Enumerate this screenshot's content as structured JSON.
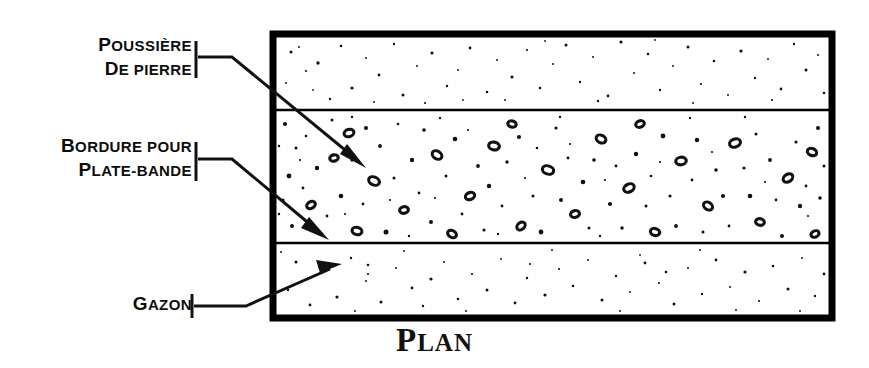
{
  "figure": {
    "caption": "PLAN",
    "caption_initial": "P",
    "caption_rest": "LAN",
    "background_color": "#ffffff",
    "ink_color": "#000000"
  },
  "callouts": [
    {
      "name": "poussiere-de-pierre",
      "line1_initial": "P",
      "line1_rest": "OUSSIÈRE",
      "line2_initial": "D",
      "line2_rest": "E PIERRE",
      "full_text": "POUSSIÈRE DE PIERRE",
      "points_to": "middle-aggregate-band"
    },
    {
      "name": "bordure-pour-plate-bande",
      "line1_initial": "B",
      "line1_rest": "ORDURE POUR",
      "line2_initial": "P",
      "line2_rest": "LATE-BANDE",
      "full_text": "BORDURE POUR PLATE-BANDE",
      "points_to": "lower-divider-edge"
    },
    {
      "name": "gazon",
      "line1_initial": "G",
      "line1_rest": "AZON",
      "line2_initial": "",
      "line2_rest": "",
      "full_text": "GAZON",
      "points_to": "bottom-lawn-band"
    }
  ],
  "diagram": {
    "frame": {
      "x": 273,
      "y": 34,
      "width": 559,
      "height": 284,
      "stroke_width": 7
    },
    "dividers": [
      {
        "name": "upper-divider",
        "y": 110,
        "stroke_width": 2.6
      },
      {
        "name": "lower-divider",
        "y": 243,
        "stroke_width": 2.6
      }
    ],
    "bands": [
      {
        "name": "top-lawn-band",
        "label": "GAZON",
        "y_top": 38,
        "y_bottom": 109,
        "texture": "sparse-speckle"
      },
      {
        "name": "middle-aggregate-band",
        "label": "POUSSIÈRE DE PIERRE",
        "y_top": 112,
        "y_bottom": 241,
        "texture": "dense-gravel"
      },
      {
        "name": "bottom-lawn-band",
        "label": "GAZON",
        "y_top": 245,
        "y_bottom": 314,
        "texture": "sparse-speckle"
      }
    ]
  }
}
